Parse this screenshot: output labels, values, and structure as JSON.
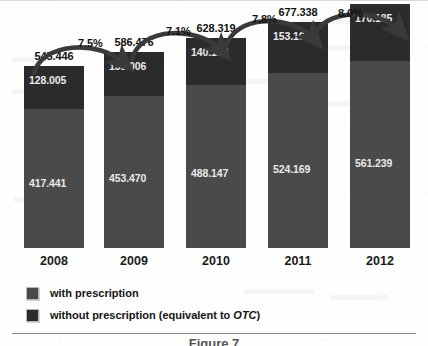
{
  "chart_data": {
    "type": "bar",
    "subtype": "stacked-bar",
    "title": "",
    "subtitle": "",
    "xlabel": "",
    "ylabel": "",
    "grid": false,
    "axis_visible": "x-only",
    "ylim": [
      0,
      731.424
    ],
    "categories": [
      "2008",
      "2009",
      "2010",
      "2011",
      "2012"
    ],
    "series": [
      {
        "name": "with prescription",
        "color": "#4a4a4a",
        "stack_position": "bottom",
        "values": [
          417.441,
          453.47,
          488.147,
          524.169,
          561.239
        ],
        "value_labels": [
          "417.441",
          "453.470",
          "488.147",
          "524.169",
          "561.239"
        ]
      },
      {
        "name": "without prescription (equivalent to OTC)",
        "color": "#2b2b2b",
        "stack_position": "top",
        "values": [
          128.005,
          133.006,
          140.172,
          153.169,
          170.185
        ],
        "value_labels": [
          "128.005",
          "133.006",
          "140.172",
          "153.169",
          "170.185"
        ]
      }
    ],
    "totals": [
      545.446,
      586.476,
      628.319,
      677.338,
      731.424
    ],
    "total_labels": [
      "545.446",
      "586.476",
      "628.319",
      "677.338",
      "731.424"
    ],
    "annotations": {
      "type": "growth-arrows",
      "labels": [
        "7.5%",
        "7.1%",
        "7.8%",
        "8.0%"
      ],
      "from_to": [
        [
          "2008",
          "2009"
        ],
        [
          "2009",
          "2010"
        ],
        [
          "2010",
          "2011"
        ],
        [
          "2011",
          "2012"
        ]
      ]
    },
    "legend": {
      "position": "bottom-left",
      "entries": [
        {
          "label": "with prescription",
          "color": "#4a4a4a",
          "italic_part": ""
        },
        {
          "label": "without prescription (equivalent to OTC)",
          "color": "#2b2b2b",
          "italic_part": "OTC"
        }
      ]
    }
  },
  "bars": [
    {
      "year": "2008",
      "total_label": "545.446",
      "top_label": "128.005",
      "bottom_label": "417.441"
    },
    {
      "year": "2009",
      "total_label": "586.476",
      "top_label": "133.006",
      "bottom_label": "453.470"
    },
    {
      "year": "2010",
      "total_label": "628.319",
      "top_label": "140.172",
      "bottom_label": "488.147"
    },
    {
      "year": "2011",
      "total_label": "677.338",
      "top_label": "153.169",
      "bottom_label": "524.169"
    },
    {
      "year": "2012",
      "total_label": "731.424",
      "top_label": "170.185",
      "bottom_label": "561.239"
    }
  ],
  "growth": {
    "g1": "7.5%",
    "g2": "7.1%",
    "g3": "7.8%",
    "g4": "8.0%"
  },
  "legend": {
    "item1": "with prescription",
    "item2_pre": "without prescription (equivalent  to ",
    "item2_italic": "OTC",
    "item2_post": ")"
  },
  "caption": "Figure 7",
  "colors": {
    "with_prescription": "#4a4a4a",
    "without_prescription": "#2b2b2b",
    "axis": "#8a8a8a",
    "text": "#111111",
    "value_text": "#eaeaea",
    "arrow": "#3a3a3a"
  }
}
